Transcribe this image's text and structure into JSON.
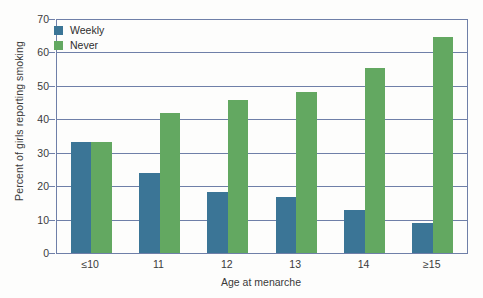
{
  "chart_data": {
    "type": "bar",
    "title": "",
    "xlabel": "Age at menarche",
    "ylabel": "Percent of girls reporting smoking",
    "categories": [
      "≤10",
      "11",
      "12",
      "13",
      "14",
      "≥15"
    ],
    "series": [
      {
        "name": "Weekly",
        "color": "#3b7596",
        "values": [
          33.3,
          23.8,
          18.3,
          16.8,
          12.9,
          9.1
        ]
      },
      {
        "name": "Never",
        "color": "#63a861",
        "values": [
          33.3,
          42.0,
          45.8,
          48.2,
          55.2,
          64.7
        ]
      }
    ],
    "ylim": [
      0,
      70
    ],
    "yticks": [
      0,
      10,
      20,
      30,
      40,
      50,
      60,
      70
    ],
    "ytick_labels": [
      "0",
      "10",
      "20",
      "30",
      "40",
      "50",
      "60",
      "70"
    ],
    "grid": "horizontal",
    "legend_position": "top-left",
    "axis_color": "#6f7fa8"
  }
}
